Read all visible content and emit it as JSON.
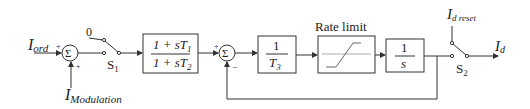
{
  "diagram": {
    "inputs": {
      "i_ord": {
        "main": "I",
        "sub": "ord"
      },
      "i_modulation": {
        "main": "I",
        "sub": "Modulation"
      },
      "zero": "0",
      "i_d_reset": {
        "main": "I",
        "sub": "d reset"
      }
    },
    "output": {
      "main": "I",
      "sub": "d"
    },
    "sum_symbol": "Σ",
    "signs": {
      "sum1_left": "+",
      "sum1_bottom": "+",
      "sum2_left": "+",
      "sum2_bottom": "−"
    },
    "switch1": {
      "main": "S",
      "sub": "1"
    },
    "switch2": {
      "main": "S",
      "sub": "2"
    },
    "lead_lag": {
      "num": "1 + sT",
      "num_sub": "1",
      "den": "1 + sT",
      "den_sub": "2"
    },
    "gain_block": {
      "num": "1",
      "den": "T",
      "den_sub": "3"
    },
    "rate_limit_label": "Rate limit",
    "integrator": {
      "num": "1",
      "den": "s"
    }
  }
}
